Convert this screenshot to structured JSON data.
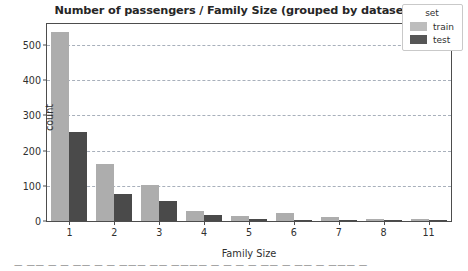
{
  "chart_data": {
    "type": "bar",
    "title": "Number of passengers / Family Size (grouped by dataset)",
    "xlabel": "Family Size",
    "ylabel": "count",
    "categories": [
      "1",
      "2",
      "3",
      "4",
      "5",
      "6",
      "7",
      "8",
      "11"
    ],
    "series": [
      {
        "name": "train",
        "color": "#adadad",
        "values": [
          537,
          161,
          102,
          29,
          15,
          22,
          12,
          6,
          7
        ]
      },
      {
        "name": "test",
        "color": "#4a4a4a",
        "values": [
          253,
          76,
          57,
          16,
          7,
          4,
          4,
          2,
          4
        ]
      }
    ],
    "ylim": [
      0,
      560
    ],
    "yticks": [
      0,
      100,
      200,
      300,
      400,
      500
    ],
    "ytick_labels": [
      "0",
      "100",
      "200",
      "300",
      "400",
      "500"
    ],
    "grid": "horizontal-dashed",
    "legend": {
      "title": "set",
      "position": "upper-right",
      "entries": [
        {
          "label": "train",
          "color": "#bdbdbd"
        },
        {
          "label": "test",
          "color": "#565656"
        }
      ]
    }
  },
  "footer": {
    "cropped_text": "—  ——  — —  —— —  — ——— —— ————  — —  — — —— —  —— —  ——— —"
  }
}
